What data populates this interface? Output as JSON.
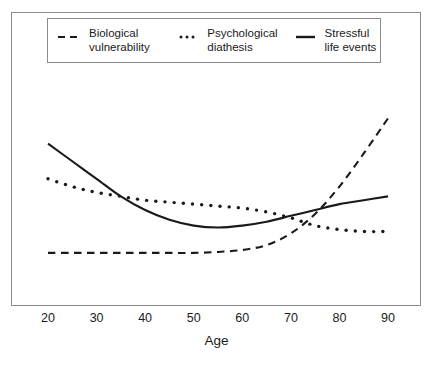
{
  "figure": {
    "background": "#ffffff",
    "frame_color": "#8c8c8c",
    "line_color": "#1a1a1a"
  },
  "legend": {
    "entries": [
      {
        "sample": "dashed-line-sample",
        "label": "Biological\nvulnerability"
      },
      {
        "sample": "dotted-line-sample",
        "label": "Psychological\ndiathesis"
      },
      {
        "sample": "solid-line-sample",
        "label": "Stressful\nlife events"
      }
    ]
  },
  "axis": {
    "x_title": "Age",
    "x_ticks": [
      "20",
      "30",
      "40",
      "50",
      "60",
      "70",
      "80",
      "90"
    ]
  },
  "chart_data": {
    "type": "line",
    "title": "",
    "subtitle": "",
    "xlabel": "Age",
    "ylabel": "",
    "xlim": [
      20,
      90
    ],
    "ylim": [
      0,
      100
    ],
    "grid": false,
    "legend_position": "top",
    "x_ticks": [
      20,
      30,
      40,
      50,
      60,
      70,
      80,
      90
    ],
    "y_ticks": [],
    "x": [
      20,
      25,
      30,
      35,
      40,
      45,
      50,
      55,
      60,
      65,
      70,
      75,
      80,
      85,
      90
    ],
    "series": [
      {
        "name": "Biological vulnerability",
        "style": "dashed",
        "color": "#1a1a1a",
        "values": [
          18,
          18,
          18,
          18,
          18,
          18,
          18,
          18.5,
          19.5,
          22,
          28,
          38,
          52,
          69,
          87
        ]
      },
      {
        "name": "Psychological diathesis",
        "style": "dotted",
        "color": "#1a1a1a",
        "values": [
          56,
          52,
          49,
          47,
          45,
          44,
          43,
          42,
          41,
          39,
          36,
          32,
          30,
          29,
          29
        ]
      },
      {
        "name": "Stressful life events",
        "style": "solid",
        "color": "#1a1a1a",
        "values": [
          74,
          65,
          56,
          47,
          40,
          35,
          32,
          31,
          32,
          34,
          37,
          40,
          43,
          45,
          47
        ]
      }
    ]
  }
}
